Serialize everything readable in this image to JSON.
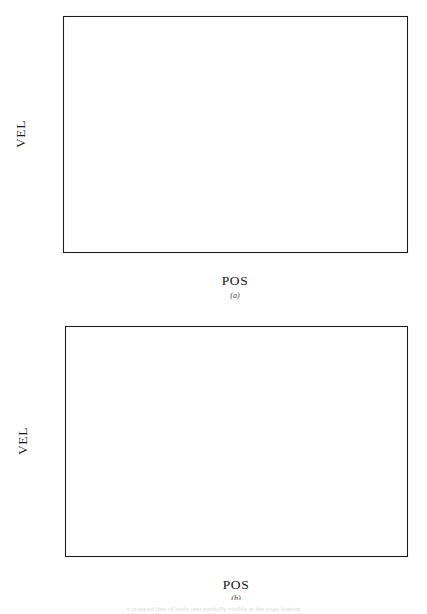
{
  "figure": {
    "background": "#ffffff",
    "ink_color": "#1a1a1a",
    "caption_remnant": "a cropped line of body text partially visible at the page bottom"
  },
  "panels": [
    {
      "id": "a",
      "label": "(a)",
      "xlabel": "POS",
      "ylabel": "VEL"
    },
    {
      "id": "b",
      "label": "(b)",
      "xlabel": "POS",
      "ylabel": "VEL"
    }
  ],
  "chart_data": [
    {
      "type": "line",
      "panel": "a",
      "title": "",
      "xlabel": "POS",
      "ylabel": "VEL",
      "xlim": [
        -0.2,
        0.8
      ],
      "ylim": [
        -0.6,
        0.8
      ],
      "xticks": [
        -0.2,
        0.0,
        0.2,
        0.4,
        0.6,
        0.8
      ],
      "xticklabels": [
        "-0.2",
        "0.0",
        "0.2",
        "0.4",
        "0.6",
        "0.8"
      ],
      "yticks": [
        -0.6,
        -0.4,
        -0.2,
        0.0,
        0.2,
        0.4,
        0.6,
        0.8
      ],
      "yticklabels": [
        "-0.6",
        "-0.4",
        "-0.2",
        "0.0",
        "0.2",
        "0.4",
        "0.6",
        "0.8"
      ],
      "minor_ticks_per_interval": 4,
      "grid": false,
      "legend": "none",
      "tick_direction": "in",
      "series": [
        {
          "name": "outer orbit",
          "style": "solid",
          "closed": true,
          "points": [
            [
              0.79,
              0.15
            ],
            [
              0.788,
              0.255
            ],
            [
              0.775,
              0.355
            ],
            [
              0.752,
              0.44
            ],
            [
              0.716,
              0.515
            ],
            [
              0.668,
              0.577
            ],
            [
              0.61,
              0.624
            ],
            [
              0.54,
              0.658
            ],
            [
              0.462,
              0.677
            ],
            [
              0.378,
              0.683
            ],
            [
              0.294,
              0.676
            ],
            [
              0.214,
              0.656
            ],
            [
              0.14,
              0.623
            ],
            [
              0.072,
              0.578
            ],
            [
              0.014,
              0.521
            ],
            [
              -0.035,
              0.452
            ],
            [
              -0.075,
              0.374
            ],
            [
              -0.105,
              0.288
            ],
            [
              -0.124,
              0.197
            ],
            [
              -0.131,
              0.103
            ],
            [
              -0.126,
              0.008
            ],
            [
              -0.109,
              -0.085
            ],
            [
              -0.081,
              -0.174
            ],
            [
              -0.043,
              -0.258
            ],
            [
              0.005,
              -0.334
            ],
            [
              0.062,
              -0.401
            ],
            [
              0.127,
              -0.458
            ],
            [
              0.199,
              -0.503
            ],
            [
              0.276,
              -0.536
            ],
            [
              0.357,
              -0.558
            ],
            [
              0.44,
              -0.569
            ],
            [
              0.522,
              -0.568
            ],
            [
              0.6,
              -0.554
            ],
            [
              0.672,
              -0.527
            ],
            [
              0.723,
              -0.49
            ],
            [
              0.757,
              -0.432
            ],
            [
              0.778,
              -0.356
            ],
            [
              0.789,
              -0.258
            ],
            [
              0.793,
              -0.15
            ],
            [
              0.793,
              -0.04
            ],
            [
              0.79,
              0.06
            ],
            [
              0.79,
              0.15
            ]
          ]
        },
        {
          "name": "inner orbit",
          "style": "solid",
          "closed": true,
          "points": [
            [
              0.77,
              0.21
            ],
            [
              0.757,
              0.305
            ],
            [
              0.733,
              0.385
            ],
            [
              0.698,
              0.452
            ],
            [
              0.652,
              0.505
            ],
            [
              0.597,
              0.541
            ],
            [
              0.535,
              0.558
            ],
            [
              0.47,
              0.556
            ],
            [
              0.406,
              0.538
            ],
            [
              0.345,
              0.505
            ],
            [
              0.291,
              0.46
            ],
            [
              0.345,
              0.505
            ],
            [
              0.291,
              0.46
            ],
            [
              0.247,
              0.404
            ],
            [
              0.216,
              0.34
            ],
            [
              0.199,
              0.27
            ],
            [
              0.196,
              0.196
            ],
            [
              0.205,
              0.12
            ],
            [
              0.226,
              0.046
            ],
            [
              0.258,
              -0.025
            ],
            [
              0.299,
              -0.091
            ],
            [
              0.348,
              -0.151
            ],
            [
              0.403,
              -0.204
            ],
            [
              0.463,
              -0.249
            ],
            [
              0.526,
              -0.286
            ],
            [
              0.589,
              -0.315
            ],
            [
              0.65,
              -0.337
            ],
            [
              0.706,
              -0.354
            ],
            [
              0.752,
              -0.368
            ],
            [
              0.783,
              -0.378
            ],
            [
              0.795,
              -0.385
            ],
            [
              0.79,
              -0.33
            ],
            [
              0.786,
              -0.24
            ],
            [
              0.782,
              -0.14
            ],
            [
              0.777,
              -0.035
            ],
            [
              0.772,
              0.075
            ],
            [
              0.77,
              0.16
            ],
            [
              0.77,
              0.21
            ]
          ]
        }
      ],
      "notes": "Two nearly-closed oval orbits; the larger outer loop and smaller inner loop graze each other near POS = 0.77, VEL = 0.5"
    },
    {
      "type": "line",
      "panel": "b",
      "title": "",
      "xlabel": "POS",
      "ylabel": "VEL",
      "xlim": [
        -1.5,
        1.0
      ],
      "ylim": [
        -1.0,
        1.0
      ],
      "xticks": [
        -1.5,
        -1.0,
        -0.5,
        0.0,
        0.5,
        1.0
      ],
      "xticklabels": [
        "-1.5",
        "-1.0",
        "-0.5",
        "0.0",
        "0.5",
        "1.0"
      ],
      "yticks": [
        -1.0,
        -0.5,
        0.0,
        0.5,
        1.0
      ],
      "yticklabels": [
        "-1.0",
        "-0.5",
        "0.0",
        "0.5",
        "1.0"
      ],
      "minor_ticks_per_interval": 4,
      "grid": false,
      "legend": "none",
      "tick_direction": "in",
      "series": [
        {
          "name": "decaying spiral trajectory",
          "style": "dotted",
          "closed": false,
          "description": "Dotted trajectory spiralling inward from a large leftward excursion toward an attractor near POS = 0.5, VEL = 0.0",
          "loops": [
            {
              "cx": -0.22,
              "cy": -0.02,
              "rx": 0.86,
              "ry": 0.78,
              "rot": -14
            },
            {
              "cx": -0.06,
              "cy": -0.02,
              "rx": 0.76,
              "ry": 0.8,
              "rot": -10
            },
            {
              "cx": 0.05,
              "cy": -0.01,
              "rx": 0.7,
              "ry": 0.8,
              "rot": -8
            },
            {
              "cx": 0.14,
              "cy": -0.01,
              "rx": 0.64,
              "ry": 0.78,
              "rot": -6
            },
            {
              "cx": 0.22,
              "cy": 0.0,
              "rx": 0.58,
              "ry": 0.75,
              "rot": -5
            },
            {
              "cx": 0.29,
              "cy": 0.0,
              "rx": 0.52,
              "ry": 0.72,
              "rot": -4
            },
            {
              "cx": 0.34,
              "cy": 0.0,
              "rx": 0.47,
              "ry": 0.69,
              "rot": -3
            },
            {
              "cx": 0.38,
              "cy": 0.0,
              "rx": 0.43,
              "ry": 0.66,
              "rot": -2
            },
            {
              "cx": 0.42,
              "cy": 0.0,
              "rx": 0.39,
              "ry": 0.62,
              "rot": -2
            },
            {
              "cx": 0.45,
              "cy": 0.0,
              "rx": 0.36,
              "ry": 0.58,
              "rot": -1
            }
          ]
        },
        {
          "name": "solid inner trajectory",
          "style": "solid",
          "closed": false,
          "description": "Darker solid path with a narrow hairpin near POS = -0.17, VEL = 0.05 and a tight hook near POS = 0.60, VEL = 0.12",
          "points": [
            [
              -0.175,
              0.015
            ],
            [
              -0.178,
              0.09
            ],
            [
              -0.175,
              0.175
            ],
            [
              -0.168,
              0.265
            ],
            [
              -0.155,
              0.35
            ],
            [
              -0.135,
              0.43
            ],
            [
              -0.108,
              0.5
            ],
            [
              -0.072,
              0.556
            ],
            [
              -0.028,
              0.596
            ],
            [
              0.022,
              0.617
            ],
            [
              0.076,
              0.619
            ],
            [
              0.13,
              0.604
            ],
            [
              0.182,
              0.575
            ],
            [
              0.23,
              0.535
            ],
            [
              0.272,
              0.487
            ],
            [
              0.308,
              0.434
            ],
            [
              0.34,
              0.38
            ],
            [
              0.372,
              0.33
            ],
            [
              0.408,
              0.288
            ],
            [
              0.452,
              0.258
            ],
            [
              0.5,
              0.243
            ],
            [
              0.548,
              0.243
            ],
            [
              0.592,
              0.253
            ],
            [
              0.63,
              0.268
            ],
            [
              0.664,
              0.282
            ],
            [
              0.7,
              0.29
            ],
            [
              0.738,
              0.288
            ],
            [
              0.772,
              0.272
            ],
            [
              0.798,
              0.24
            ],
            [
              0.812,
              0.196
            ],
            [
              0.812,
              0.146
            ],
            [
              0.796,
              0.1
            ],
            [
              0.766,
              0.062
            ],
            [
              0.724,
              0.034
            ],
            [
              0.676,
              0.02
            ],
            [
              0.63,
              0.024
            ],
            [
              0.598,
              0.05
            ],
            [
              0.588,
              0.094
            ],
            [
              0.6,
              0.128
            ],
            [
              0.622,
              0.14
            ],
            [
              0.64,
              0.13
            ],
            [
              0.646,
              0.1
            ],
            [
              0.638,
              0.06
            ],
            [
              0.616,
              0.014
            ],
            [
              0.582,
              -0.034
            ],
            [
              0.54,
              -0.08
            ],
            [
              0.492,
              -0.124
            ],
            [
              0.44,
              -0.162
            ],
            [
              0.386,
              -0.192
            ],
            [
              0.33,
              -0.212
            ],
            [
              0.274,
              -0.222
            ],
            [
              0.22,
              -0.22
            ],
            [
              0.17,
              -0.206
            ],
            [
              0.126,
              -0.18
            ],
            [
              0.09,
              -0.142
            ],
            [
              0.064,
              -0.094
            ],
            [
              0.05,
              -0.038
            ],
            [
              0.048,
              0.022
            ],
            [
              0.058,
              0.08
            ]
          ]
        },
        {
          "name": "solid outer sweep",
          "style": "solid",
          "closed": false,
          "description": "Second darker sweep crossing the upper-right region",
          "points": [
            [
              -0.04,
              0.56
            ],
            [
              0.03,
              0.604
            ],
            [
              0.108,
              0.63
            ],
            [
              0.19,
              0.638
            ],
            [
              0.272,
              0.626
            ],
            [
              0.35,
              0.596
            ],
            [
              0.422,
              0.552
            ],
            [
              0.486,
              0.496
            ],
            [
              0.542,
              0.43
            ],
            [
              0.588,
              0.36
            ],
            [
              0.626,
              0.288
            ],
            [
              0.66,
              0.22
            ],
            [
              0.696,
              0.162
            ],
            [
              0.738,
              0.12
            ],
            [
              0.784,
              0.098
            ],
            [
              0.828,
              0.1
            ],
            [
              0.862,
              0.124
            ]
          ]
        }
      ],
      "notes": "Dotted spiral collapses inward from large loops on the left toward a small attracting region near POS = 0.5"
    }
  ]
}
